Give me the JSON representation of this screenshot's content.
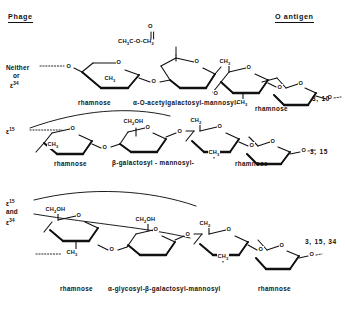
{
  "figure": {
    "header_left": "Phage",
    "header_right": "O antigen",
    "acetyl_group": "CH3C-O-CH2",
    "acetyl_carbonyl": "O"
  },
  "rows": [
    {
      "phage_label": "Neither ε or ε 34",
      "phage_lines": [
        "Neither",
        "or",
        "ε"
      ],
      "phage_sup": "34",
      "serotype": "3, 10",
      "captions": {
        "left": "rhamnose",
        "middle": "α-O-acetylgalactosyl-mannosyl-",
        "right": "rhamnose"
      },
      "ring_labels": [
        "CH3",
        "O",
        "O",
        "CH2",
        "O",
        "O",
        "CH3",
        "O",
        "O"
      ]
    },
    {
      "phage_label": "ε 15",
      "phage_lines": [
        "ε"
      ],
      "phage_sup": "15",
      "serotype": "3, 15",
      "captions": {
        "left": "rhamnose",
        "middle": "β-galactosyl - mannosyl-",
        "right": "rhamnose"
      },
      "ring_labels": [
        "CH3",
        "O",
        "O",
        "CH2OH",
        "CH2",
        "O",
        "O",
        "CH3",
        "O"
      ]
    },
    {
      "phage_label": "ε 15 and ε 34",
      "phage_lines": [
        "ε",
        "and",
        "ε"
      ],
      "phage_sup_a": "15",
      "phage_sup_b": "34",
      "serotype": "3, 15, 34",
      "captions": {
        "left": "rhamnose",
        "middle": "α-glycosyl-β-galactosyl-mannosyl",
        "right": "rhamnose"
      },
      "ring_labels": [
        "CH2OH",
        "CH3",
        "O",
        "CH2OH",
        "O",
        "CH2",
        "O",
        "CH3",
        "O"
      ]
    }
  ],
  "atoms": {
    "o": "O",
    "ch2": "CH2",
    "ch3": "CH3",
    "ch2oh": "CH2OH"
  }
}
